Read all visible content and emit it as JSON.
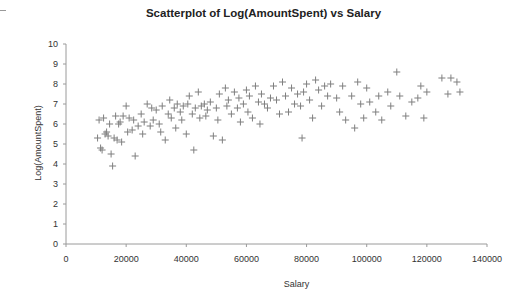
{
  "chart_data": {
    "type": "scatter",
    "title": "Scatterplot of Log(AmountSpent) vs Salary",
    "xlabel": "Salary",
    "ylabel": "Log(AmountSpent)",
    "xlim": [
      0,
      140000
    ],
    "ylim": [
      0,
      10
    ],
    "xticks": [
      0,
      20000,
      40000,
      60000,
      80000,
      100000,
      120000,
      140000
    ],
    "yticks": [
      0,
      1,
      2,
      3,
      4,
      5,
      6,
      7,
      8,
      9,
      10
    ],
    "grid": false,
    "legend": null,
    "marker": "+",
    "marker_color": "#7f7f7f",
    "points": [
      [
        10500,
        5.3
      ],
      [
        11000,
        6.2
      ],
      [
        11500,
        4.8
      ],
      [
        12000,
        4.7
      ],
      [
        12500,
        6.3
      ],
      [
        13000,
        5.5
      ],
      [
        13500,
        5.6
      ],
      [
        14000,
        5.4
      ],
      [
        14500,
        6.0
      ],
      [
        15000,
        4.5
      ],
      [
        15500,
        3.9
      ],
      [
        16000,
        5.3
      ],
      [
        16500,
        6.4
      ],
      [
        17000,
        5.2
      ],
      [
        17500,
        6.0
      ],
      [
        18000,
        6.1
      ],
      [
        18500,
        5.1
      ],
      [
        19000,
        6.4
      ],
      [
        20000,
        6.9
      ],
      [
        20500,
        5.6
      ],
      [
        21000,
        6.3
      ],
      [
        22000,
        5.7
      ],
      [
        22500,
        6.2
      ],
      [
        23000,
        4.4
      ],
      [
        24000,
        5.9
      ],
      [
        25000,
        6.5
      ],
      [
        25500,
        5.5
      ],
      [
        26000,
        6.1
      ],
      [
        27000,
        7.0
      ],
      [
        28000,
        5.9
      ],
      [
        28500,
        6.8
      ],
      [
        29000,
        6.2
      ],
      [
        30000,
        6.7
      ],
      [
        31000,
        6.0
      ],
      [
        31500,
        5.6
      ],
      [
        32000,
        6.9
      ],
      [
        33000,
        5.2
      ],
      [
        34000,
        6.5
      ],
      [
        34500,
        7.2
      ],
      [
        35000,
        6.3
      ],
      [
        36000,
        6.8
      ],
      [
        36500,
        5.8
      ],
      [
        37000,
        7.0
      ],
      [
        38000,
        6.6
      ],
      [
        38500,
        6.2
      ],
      [
        39000,
        6.9
      ],
      [
        40000,
        5.5
      ],
      [
        40500,
        7.0
      ],
      [
        41000,
        7.4
      ],
      [
        42000,
        6.5
      ],
      [
        42500,
        4.7
      ],
      [
        43000,
        6.8
      ],
      [
        44000,
        7.6
      ],
      [
        44500,
        6.3
      ],
      [
        45000,
        6.9
      ],
      [
        46000,
        7.0
      ],
      [
        46500,
        6.4
      ],
      [
        47000,
        6.7
      ],
      [
        48000,
        7.1
      ],
      [
        49000,
        5.4
      ],
      [
        50000,
        6.8
      ],
      [
        50500,
        6.2
      ],
      [
        51000,
        7.5
      ],
      [
        52000,
        5.2
      ],
      [
        53000,
        7.8
      ],
      [
        53500,
        6.9
      ],
      [
        54000,
        7.2
      ],
      [
        55000,
        6.5
      ],
      [
        56000,
        7.6
      ],
      [
        57000,
        6.8
      ],
      [
        57500,
        7.3
      ],
      [
        58000,
        6.1
      ],
      [
        59000,
        7.0
      ],
      [
        60000,
        7.7
      ],
      [
        60500,
        6.6
      ],
      [
        61000,
        7.4
      ],
      [
        62000,
        6.3
      ],
      [
        63000,
        7.9
      ],
      [
        64000,
        7.1
      ],
      [
        64500,
        6.0
      ],
      [
        65000,
        7.5
      ],
      [
        66000,
        7.0
      ],
      [
        67000,
        6.8
      ],
      [
        68000,
        7.3
      ],
      [
        69000,
        7.9
      ],
      [
        70000,
        7.2
      ],
      [
        71000,
        6.5
      ],
      [
        72000,
        8.1
      ],
      [
        73000,
        7.4
      ],
      [
        74000,
        6.6
      ],
      [
        75000,
        7.8
      ],
      [
        76000,
        7.0
      ],
      [
        77000,
        7.5
      ],
      [
        78000,
        6.9
      ],
      [
        78500,
        5.3
      ],
      [
        79000,
        7.6
      ],
      [
        80000,
        8.0
      ],
      [
        81000,
        7.2
      ],
      [
        82000,
        6.3
      ],
      [
        83000,
        8.2
      ],
      [
        84000,
        7.7
      ],
      [
        85000,
        6.9
      ],
      [
        86000,
        7.9
      ],
      [
        87000,
        7.4
      ],
      [
        88000,
        8.0
      ],
      [
        90000,
        7.3
      ],
      [
        91000,
        6.6
      ],
      [
        92000,
        7.9
      ],
      [
        93000,
        6.2
      ],
      [
        95000,
        7.4
      ],
      [
        96000,
        5.8
      ],
      [
        97000,
        8.1
      ],
      [
        98000,
        7.0
      ],
      [
        99000,
        6.3
      ],
      [
        100000,
        7.8
      ],
      [
        101000,
        7.1
      ],
      [
        103000,
        6.6
      ],
      [
        104000,
        7.4
      ],
      [
        105000,
        6.2
      ],
      [
        107000,
        7.6
      ],
      [
        108000,
        6.9
      ],
      [
        110000,
        8.6
      ],
      [
        111000,
        7.4
      ],
      [
        113000,
        6.4
      ],
      [
        115000,
        7.1
      ],
      [
        117000,
        7.3
      ],
      [
        118000,
        7.9
      ],
      [
        119000,
        6.3
      ],
      [
        120000,
        7.6
      ],
      [
        125000,
        8.3
      ],
      [
        127000,
        7.5
      ],
      [
        128000,
        8.3
      ],
      [
        130000,
        8.1
      ],
      [
        131000,
        7.6
      ]
    ]
  }
}
